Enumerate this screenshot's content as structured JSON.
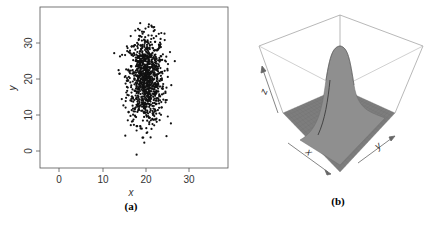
{
  "chart_data": [
    {
      "panel": "(a)",
      "type": "scatter",
      "title": "",
      "xlabel": "x",
      "ylabel": "y",
      "xlim": [
        -4,
        39
      ],
      "ylim": [
        -5,
        40
      ],
      "xticks": [
        0,
        10,
        20,
        30
      ],
      "yticks": [
        0,
        10,
        20,
        30
      ],
      "grid": false,
      "legend": null,
      "series": [
        {
          "name": "samples",
          "distribution": "bivariate normal",
          "n_points": 1000,
          "mean": [
            20,
            20
          ],
          "sd": [
            2.1,
            6.2
          ],
          "x_range_observed": [
            13,
            26
          ],
          "y_range_observed": [
            -3,
            38
          ],
          "marker": "filled circle",
          "color": "#111111"
        }
      ]
    },
    {
      "panel": "(b)",
      "type": "surface",
      "title": "",
      "xlabel": "x",
      "ylabel": "y",
      "zlabel": "z",
      "description": "3D perspective surface of the bivariate normal density; single peak centered, elongated along y",
      "peak_location": [
        20,
        20
      ],
      "color": "#8a8a8a"
    }
  ],
  "captions": {
    "a": "(a)",
    "b": "(b)"
  },
  "axes_a": {
    "xlabel": "x",
    "ylabel": "y",
    "xtick_labels": [
      "0",
      "10",
      "20",
      "30"
    ],
    "ytick_labels": [
      "0",
      "10",
      "20",
      "30"
    ]
  },
  "axes_b": {
    "xlabel": "x",
    "ylabel": "y",
    "zlabel": "z"
  }
}
